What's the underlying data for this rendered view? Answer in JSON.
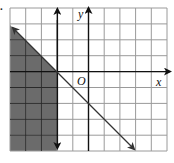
{
  "problem": {
    "number_label": "."
  },
  "graph": {
    "x_axis_label": "x",
    "y_axis_label": "y",
    "origin_label": "O",
    "grid": {
      "x_min": -5,
      "x_max": 5,
      "y_min": -5,
      "y_max": 4,
      "step": 1
    },
    "boundaries": [
      {
        "type": "line",
        "equation": "y = -x - 2",
        "style": "solid",
        "arrows": true
      },
      {
        "type": "line",
        "equation": "x = -2",
        "style": "solid",
        "arrows": true
      }
    ],
    "shaded_region": {
      "description": "x <= -2 and y <= -x - 2",
      "color": "#6b6b6b"
    },
    "colors": {
      "grid": "#9a9a9a",
      "axis": "#111111",
      "shade": "#6b6b6b",
      "background": "#ffffff"
    }
  }
}
